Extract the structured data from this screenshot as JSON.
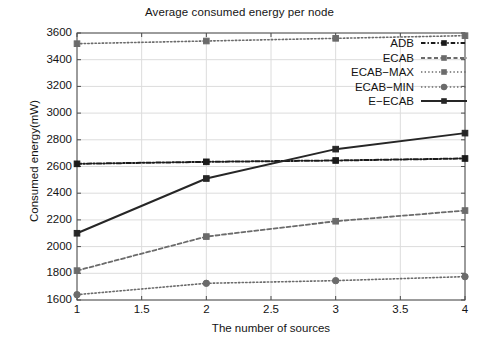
{
  "chart_data": {
    "type": "line",
    "title": "Average consumed energy per node",
    "xlabel": "The number of sources",
    "ylabel": "Consumed energy(mW)",
    "xlim": [
      1,
      4
    ],
    "ylim": [
      1600,
      3600
    ],
    "xticks": [
      1,
      1.5,
      2,
      2.5,
      3,
      3.5,
      4
    ],
    "xtick_labels": [
      "1",
      "1.5",
      "2",
      "2.5",
      "3",
      "3.5",
      "4"
    ],
    "yticks": [
      1600,
      1800,
      2000,
      2200,
      2400,
      2600,
      2800,
      3000,
      3200,
      3400,
      3600
    ],
    "ytick_labels": [
      "1600",
      "1800",
      "2000",
      "2200",
      "2400",
      "2600",
      "2800",
      "3000",
      "3200",
      "3400",
      "3600"
    ],
    "grid": true,
    "legend_position": "upper right",
    "x": [
      1,
      2,
      3,
      4
    ],
    "series": [
      {
        "name": "ADB",
        "values": [
          2620,
          2635,
          2645,
          2660
        ],
        "style": "dash-dot",
        "color": "#1a1a1a",
        "marker": "square"
      },
      {
        "name": "ECAB",
        "values": [
          1820,
          2075,
          2190,
          2270
        ],
        "style": "dashed",
        "color": "#6b6b6b",
        "marker": "square"
      },
      {
        "name": "ECAB-MAX",
        "values": [
          3520,
          3540,
          3560,
          3580
        ],
        "style": "dotted",
        "color": "#6b6b6b",
        "marker": "square"
      },
      {
        "name": "ECAB-MIN",
        "values": [
          1640,
          1725,
          1745,
          1775
        ],
        "style": "dotted",
        "color": "#6b6b6b",
        "marker": "circle"
      },
      {
        "name": "E-ECAB",
        "values": [
          2100,
          2510,
          2730,
          2850
        ],
        "style": "solid",
        "color": "#262626",
        "marker": "square"
      }
    ]
  },
  "legend": {
    "entries": [
      {
        "label": "ADB"
      },
      {
        "label": "ECAB"
      },
      {
        "label": "ECAB−MAX"
      },
      {
        "label": "ECAB−MIN"
      },
      {
        "label": "E−ECAB"
      }
    ]
  },
  "colors": {
    "axis": "#4a4a4a",
    "grid": "#dcdcdc",
    "background": "#ffffff",
    "text": "#141414"
  }
}
